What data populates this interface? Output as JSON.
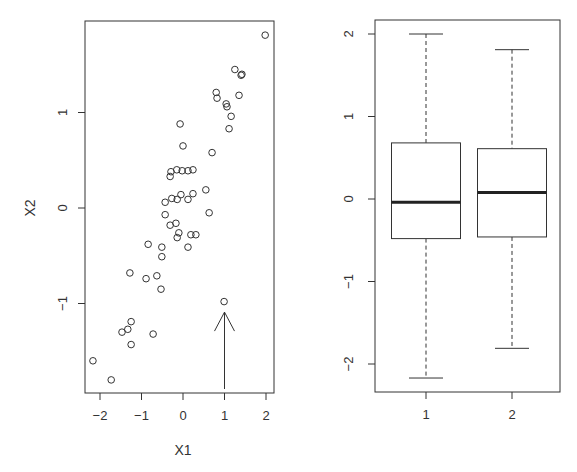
{
  "chart_data": [
    {
      "type": "scatter",
      "title": "",
      "xlabel": "X1",
      "ylabel": "X2",
      "xlim": [
        -2.35,
        2.2
      ],
      "ylim": [
        -1.95,
        1.95
      ],
      "xticks": [
        -2,
        -1,
        0,
        1,
        2
      ],
      "yticks": [
        -1,
        0,
        1
      ],
      "grid": false,
      "legend": null,
      "points": [
        [
          1.98,
          1.81
        ],
        [
          1.25,
          1.45
        ],
        [
          1.42,
          1.4
        ],
        [
          1.4,
          1.39
        ],
        [
          1.35,
          1.18
        ],
        [
          0.8,
          1.21
        ],
        [
          0.82,
          1.15
        ],
        [
          1.04,
          1.09
        ],
        [
          1.06,
          1.06
        ],
        [
          1.16,
          0.96
        ],
        [
          1.11,
          0.83
        ],
        [
          -0.07,
          0.88
        ],
        [
          0.0,
          0.65
        ],
        [
          0.7,
          0.58
        ],
        [
          -0.29,
          0.38
        ],
        [
          -0.15,
          0.4
        ],
        [
          -0.02,
          0.39
        ],
        [
          0.12,
          0.39
        ],
        [
          0.24,
          0.4
        ],
        [
          -0.31,
          0.33
        ],
        [
          0.55,
          0.19
        ],
        [
          -0.43,
          0.06
        ],
        [
          -0.27,
          0.1
        ],
        [
          -0.14,
          0.09
        ],
        [
          -0.05,
          0.14
        ],
        [
          0.12,
          0.09
        ],
        [
          0.24,
          0.15
        ],
        [
          -0.43,
          -0.07
        ],
        [
          0.63,
          -0.05
        ],
        [
          -0.31,
          -0.18
        ],
        [
          -0.17,
          -0.16
        ],
        [
          -0.1,
          -0.26
        ],
        [
          -0.14,
          -0.31
        ],
        [
          0.19,
          -0.28
        ],
        [
          0.31,
          -0.28
        ],
        [
          -0.84,
          -0.38
        ],
        [
          -0.51,
          -0.41
        ],
        [
          0.12,
          -0.41
        ],
        [
          -0.51,
          -0.51
        ],
        [
          -1.28,
          -0.68
        ],
        [
          -0.89,
          -0.74
        ],
        [
          -0.63,
          -0.71
        ],
        [
          -0.53,
          -0.85
        ],
        [
          0.99,
          -0.98
        ],
        [
          -1.25,
          -1.19
        ],
        [
          -1.33,
          -1.27
        ],
        [
          -1.47,
          -1.3
        ],
        [
          -0.72,
          -1.32
        ],
        [
          -1.25,
          -1.43
        ],
        [
          -2.17,
          -1.6
        ],
        [
          -1.73,
          -1.8
        ]
      ],
      "annotations": [
        {
          "type": "arrow",
          "from": [
            1.0,
            -1.95
          ],
          "to": [
            1.0,
            -1.09
          ],
          "points_to": [
            0.99,
            -0.98
          ]
        }
      ]
    },
    {
      "type": "box",
      "title": "",
      "xlabel": "",
      "ylabel": "",
      "categories": [
        "1",
        "2"
      ],
      "ylim": [
        -2.3,
        2.2
      ],
      "yticks": [
        -2,
        -1,
        0,
        1,
        2
      ],
      "grid": false,
      "legend": null,
      "series": [
        {
          "name": "1",
          "whisker_low": -2.17,
          "q1": -0.48,
          "median": -0.04,
          "q3": 0.68,
          "whisker_high": 2.0
        },
        {
          "name": "2",
          "whisker_low": -1.81,
          "q1": -0.46,
          "median": 0.08,
          "q3": 0.61,
          "whisker_high": 1.81
        }
      ]
    }
  ]
}
